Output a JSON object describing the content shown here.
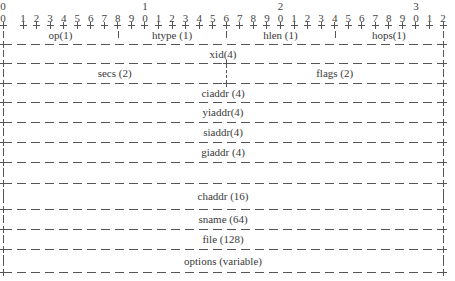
{
  "diagram": {
    "bit_ruler": {
      "tens": [
        {
          "label": "0",
          "bit": 0
        },
        {
          "label": "1",
          "bit": 10
        },
        {
          "label": "2",
          "bit": 20
        },
        {
          "label": "3",
          "bit": 30
        }
      ],
      "units": [
        "0",
        "1",
        "2",
        "3",
        "4",
        "5",
        "6",
        "7",
        "8",
        "9",
        "0",
        "1",
        "2",
        "3",
        "4",
        "5",
        "6",
        "7",
        "8",
        "9",
        "0",
        "1",
        "2",
        "3",
        "4",
        "5",
        "6",
        "7",
        "8",
        "9",
        "0",
        "1",
        "2"
      ]
    },
    "rows": [
      {
        "fields": [
          {
            "label": "op(1)",
            "start": 0,
            "end": 8
          },
          {
            "label": "htype (1)",
            "start": 8,
            "end": 16
          },
          {
            "label": "hlen (1)",
            "start": 16,
            "end": 24
          },
          {
            "label": "hops(1)",
            "start": 24,
            "end": 32
          }
        ]
      },
      {
        "fields": [
          {
            "label": "xid(4)",
            "start": 0,
            "end": 32
          }
        ]
      },
      {
        "fields": [
          {
            "label": "secs (2)",
            "start": 0,
            "end": 16
          },
          {
            "label": "flags (2)",
            "start": 16,
            "end": 32
          }
        ]
      },
      {
        "fields": [
          {
            "label": "ciaddr (4)",
            "start": 0,
            "end": 32
          }
        ]
      },
      {
        "fields": [
          {
            "label": "yiaddr(4)",
            "start": 0,
            "end": 32
          }
        ]
      },
      {
        "fields": [
          {
            "label": "siaddr(4)",
            "start": 0,
            "end": 32
          }
        ]
      },
      {
        "fields": [
          {
            "label": "giaddr (4)",
            "start": 0,
            "end": 32
          }
        ]
      },
      {
        "fields": [
          {
            "label": "",
            "start": 0,
            "end": 32
          }
        ]
      },
      {
        "fields": [
          {
            "label": "chaddr (16)",
            "start": 0,
            "end": 32
          }
        ]
      },
      {
        "fields": [
          {
            "label": "sname (64)",
            "start": 0,
            "end": 32
          }
        ]
      },
      {
        "fields": [
          {
            "label": "file (128)",
            "start": 0,
            "end": 32
          }
        ]
      },
      {
        "fields": [
          {
            "label": "options (variable)",
            "start": 0,
            "end": 32
          }
        ]
      }
    ],
    "colors": {
      "line": "#555555",
      "text": "#3a3a3a",
      "background": "#ffffff"
    }
  }
}
